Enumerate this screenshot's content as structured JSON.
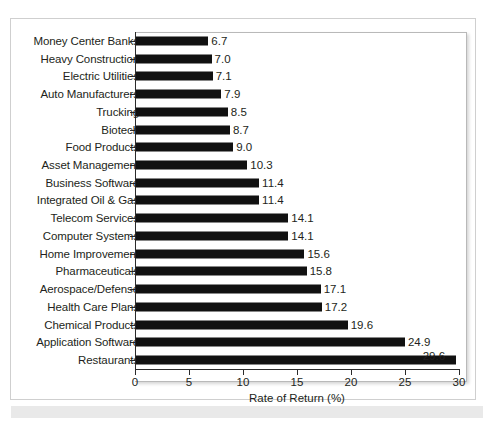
{
  "chart_data": {
    "type": "bar",
    "orientation": "horizontal",
    "title": "",
    "xlabel": "Rate of Return (%)",
    "ylabel": "",
    "xlim": [
      0,
      30
    ],
    "xticks": [
      0,
      5,
      10,
      15,
      20,
      25,
      30
    ],
    "xtick_labels": [
      "0",
      "5",
      "10",
      "15",
      "20",
      "25",
      "30"
    ],
    "grid": false,
    "legend": false,
    "bar_color": "#111111",
    "categories": [
      "Money Center Banks",
      "Heavy Construction",
      "Electric Utilities",
      "Auto Manufacturers",
      "Trucking",
      "Biotech",
      "Food Products",
      "Asset Management",
      "Business Software",
      "Integrated Oil & Gas",
      "Telecom Services",
      "Computer Systems",
      "Home Improvement",
      "Pharmaceuticals",
      "Aerospace/Defense",
      "Health Care Plans",
      "Chemical Products",
      "Application Software",
      "Restaurants"
    ],
    "values": [
      6.7,
      7.0,
      7.1,
      7.9,
      8.5,
      8.7,
      9.0,
      10.3,
      11.4,
      11.4,
      14.1,
      14.1,
      15.6,
      15.8,
      17.1,
      17.2,
      19.6,
      24.9,
      29.6
    ],
    "value_labels": [
      "6.7",
      "7.0",
      "7.1",
      "7.9",
      "8.5",
      "8.7",
      "9.0",
      "10.3",
      "11.4",
      "11.4",
      "14.1",
      "14.1",
      "15.6",
      "15.8",
      "17.1",
      "17.2",
      "19.6",
      "24.9",
      "29.6"
    ]
  }
}
